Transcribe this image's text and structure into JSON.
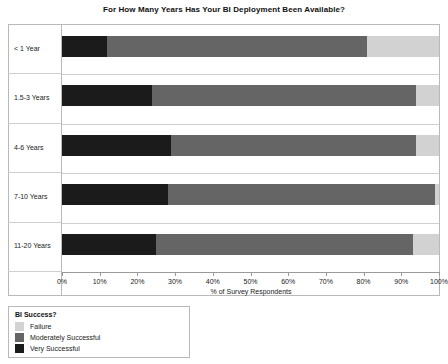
{
  "chart_data": {
    "type": "bar",
    "orientation": "horizontal",
    "stacked": true,
    "normalized": true,
    "title": "For How Many Years Has Your BI Deployment Been Available?",
    "xlabel": "% of Survey Respondents",
    "ylabel": "",
    "xlim": [
      0,
      100
    ],
    "grid": false,
    "legend_position": "bottom-left",
    "legend_title": "BI Success?",
    "categories": [
      "< 1 Year",
      "1.5-3 Years",
      "4-6 Years",
      "7-10 Years",
      "11-20 Years"
    ],
    "xticks": [
      "0%",
      "10%",
      "20%",
      "30%",
      "40%",
      "50%",
      "60%",
      "70%",
      "80%",
      "90%",
      "100%"
    ],
    "xtick_values": [
      0,
      10,
      20,
      30,
      40,
      50,
      60,
      70,
      80,
      90,
      100
    ],
    "series": [
      {
        "name": "Very Successful",
        "color": "#1b1b1b",
        "values": [
          12,
          24,
          29,
          28,
          25
        ]
      },
      {
        "name": "Moderately Successful",
        "color": "#656565",
        "values": [
          69,
          70,
          65,
          71,
          68
        ]
      },
      {
        "name": "Failure",
        "color": "#d2d2d2",
        "values": [
          19,
          6,
          6,
          1,
          7
        ]
      }
    ]
  },
  "legend": {
    "title": "BI Success?",
    "items": [
      {
        "label": "Failure",
        "color": "#d2d2d2"
      },
      {
        "label": "Moderately Successful",
        "color": "#656565"
      },
      {
        "label": "Very Successful",
        "color": "#1b1b1b"
      }
    ]
  }
}
